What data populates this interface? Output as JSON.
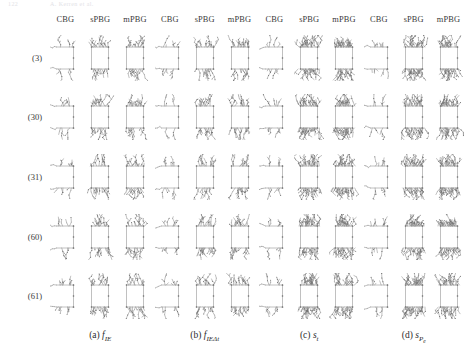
{
  "running_head": {
    "left": "122",
    "right": "A. Kerren et al."
  },
  "column_headers": [
    "CBG",
    "sPBG",
    "mPBG"
  ],
  "row_labels": [
    "(3)",
    "(30)",
    "(31)",
    "(60)",
    "(61)"
  ],
  "panels": [
    {
      "id": "a",
      "index_label": "(a)",
      "metric": "f",
      "sub": "IE",
      "subsub": ""
    },
    {
      "id": "b",
      "index_label": "(b)",
      "metric": "f",
      "sub": "IEΔt",
      "subsub": ""
    },
    {
      "id": "c",
      "index_label": "(c)",
      "metric": "s",
      "sub": "t",
      "subsub": ""
    },
    {
      "id": "d",
      "index_label": "(d)",
      "metric": "s",
      "sub": "P",
      "subsub": "e"
    }
  ],
  "style": {
    "stroke_color": "#8c8c8c",
    "node_color": "#6f6f6f",
    "background": "#ffffff",
    "text_color": "#2b2b2b"
  },
  "chart_data": {
    "type": "table",
    "rows": 5,
    "cols": 12,
    "row_categories": [
      "(3)",
      "(30)",
      "(31)",
      "(60)",
      "(61)"
    ],
    "col_categories": [
      "a-CBG",
      "a-sPBG",
      "a-mPBG",
      "b-CBG",
      "b-sPBG",
      "b-mPBG",
      "c-CBG",
      "c-sPBG",
      "c-mPBG",
      "d-CBG",
      "d-sPBG",
      "d-mPBG"
    ],
    "cell_density": [
      [
        1,
        2,
        2,
        1,
        2,
        2,
        1,
        3,
        3,
        1,
        3,
        3
      ],
      [
        1,
        2,
        2,
        1,
        2,
        2,
        1,
        3,
        3,
        1,
        3,
        3
      ],
      [
        1,
        2,
        2,
        1,
        2,
        2,
        1,
        3,
        3,
        1,
        3,
        3
      ],
      [
        1,
        2,
        2,
        1,
        2,
        2,
        1,
        3,
        3,
        1,
        3,
        3
      ],
      [
        1,
        2,
        2,
        1,
        2,
        2,
        1,
        3,
        3,
        1,
        3,
        3
      ]
    ],
    "legend": [],
    "grid": false
  }
}
